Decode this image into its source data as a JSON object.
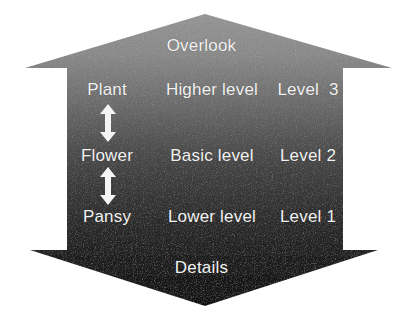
{
  "diagram": {
    "type": "vertical-double-arrow-hierarchy",
    "caption_top": "Overlook",
    "caption_bottom": "Details",
    "columns": [
      "example",
      "level_name",
      "level_number"
    ],
    "rows": [
      {
        "example": "Plant",
        "level_name": "Higher level",
        "level_number": "Level  3"
      },
      {
        "example": "Flower",
        "level_name": "Basic level",
        "level_number": "Level 2"
      },
      {
        "example": "Pansy",
        "level_name": "Lower level",
        "level_number": "Level 1"
      }
    ],
    "connectors": [
      {
        "name": "plant-flower",
        "glyph": "double-arrow-vertical-icon"
      },
      {
        "name": "flower-pansy",
        "glyph": "double-arrow-vertical-icon"
      }
    ],
    "colors": {
      "gradient_top": "#8d8d8d",
      "gradient_mid": "#3c3c3c",
      "gradient_bottom": "#141414",
      "text": "#f2f2f2",
      "background": "#ffffff"
    }
  }
}
